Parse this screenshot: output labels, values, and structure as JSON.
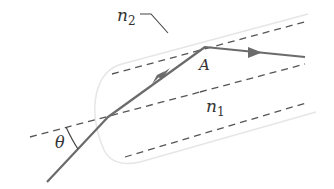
{
  "diagram": {
    "labels": {
      "n2": {
        "base": "n",
        "sub": "2"
      },
      "n1": {
        "base": "n",
        "sub": "1"
      },
      "point_A": "A",
      "angle": "θ"
    },
    "colors": {
      "ray": "#6b6b6b",
      "dashed": "#555555",
      "fiber_outline": "#e3e3e3",
      "text": "#333333"
    }
  }
}
